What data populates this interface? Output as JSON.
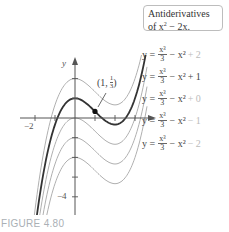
{
  "chart_data": {
    "type": "line",
    "xlabel": "",
    "ylabel": "y",
    "x_ticks": [
      -2,
      -1,
      0,
      1,
      2,
      3
    ],
    "x_tick_labels_shown": [
      "-2"
    ],
    "y_ticks": [
      2,
      1,
      -1,
      -2,
      -3,
      -4
    ],
    "y_tick_labels_shown": [
      "-4"
    ],
    "xlim": [
      -2.6,
      4.2
    ],
    "ylim": [
      -4.8,
      3.2
    ],
    "series": [
      {
        "name": "y = x^3/3 - x^2 + 2",
        "C": 2,
        "emphasis": false
      },
      {
        "name": "y = x^3/3 - x^2 + 1",
        "C": 1,
        "emphasis": true
      },
      {
        "name": "y = x^3/3 - x^2 + 0",
        "C": 0,
        "emphasis": false
      },
      {
        "name": "y = x^3/3 - x^2 - 1",
        "C": -1,
        "emphasis": false
      },
      {
        "name": "y = x^3/3 - x^2 - 2",
        "C": -2,
        "emphasis": false
      }
    ],
    "annotations": [
      {
        "text": "(1, 1/3)",
        "x": 1,
        "y": 0.3333,
        "marker": "dot"
      }
    ],
    "grid": false,
    "legend_position": "right"
  },
  "legend": {
    "line1": "Antiderivatives",
    "line2_prefix": "of x",
    "line2_sup": "2",
    "line2_suffix": " − 2x."
  },
  "equations": [
    {
      "y_eq": "y =",
      "num": "x³",
      "den": "3",
      "mid": "− x² ",
      "const": "+ 2",
      "dark": false
    },
    {
      "y_eq": "y =",
      "num": "x³",
      "den": "3",
      "mid": "− x² ",
      "const": "+ 1",
      "dark": true
    },
    {
      "y_eq": "y =",
      "num": "x³",
      "den": "3",
      "mid": "− x² ",
      "const": "+ 0",
      "dark": false
    },
    {
      "y_eq": "y =",
      "num": "x³",
      "den": "3",
      "mid": "− x² ",
      "const": "− 1",
      "dark": false
    },
    {
      "y_eq": "y =",
      "num": "x³",
      "den": "3",
      "mid": "− x² ",
      "const": "− 2",
      "dark": false
    }
  ],
  "point_label": {
    "open": "(1,",
    "num": "1",
    "den": "3",
    "close": ")"
  },
  "axis_labels": {
    "y": "y",
    "x_neg2": "−2",
    "y_neg4": "−4"
  },
  "figure_caption": "FIGURE 4.80",
  "colors": {
    "emphasis": "#333333",
    "family": "#b0b0b0",
    "axis": "#555555",
    "caption": "#aab0b5"
  }
}
